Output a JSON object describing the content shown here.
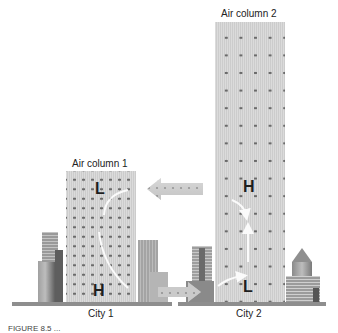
{
  "diagram": {
    "columns": [
      {
        "id": "air-column-1",
        "label": "Air column 1",
        "top_pressure": "L",
        "bottom_pressure": "H",
        "city": "City 1"
      },
      {
        "id": "air-column-2",
        "label": "Air column 2",
        "top_pressure": "H",
        "bottom_pressure": "L",
        "city": "City 2"
      }
    ],
    "arrows": [
      {
        "id": "aloft-flow",
        "direction": "right-to-left",
        "from": "Air column 2",
        "to": "Air column 1"
      },
      {
        "id": "surface-flow",
        "direction": "left-to-right",
        "from": "City 1",
        "to": "City 2"
      }
    ],
    "caption": "FIGURE 8.5 ..."
  }
}
